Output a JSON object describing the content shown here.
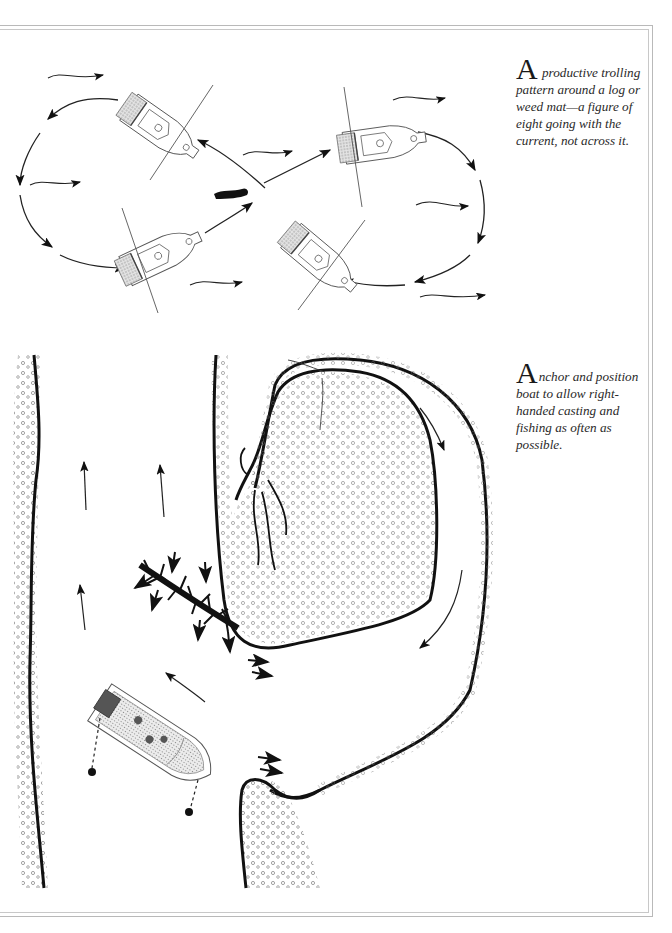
{
  "page": {
    "type": "illustrated-book-page",
    "frame": {
      "style": "double-rule",
      "color": "#b9b9b9"
    }
  },
  "figures": [
    {
      "id": "trolling-pattern",
      "caption": {
        "dropcap": "A",
        "text": " productive trolling pattern around a log or weed mat—a figure of eight going with the current, not across it."
      },
      "elements": {
        "boats": 4,
        "center_object": "log-or-weed-mat",
        "path": "figure-of-eight",
        "current_arrows": 6
      }
    },
    {
      "id": "anchor-position",
      "caption": {
        "dropcap": "A",
        "text": "nchor and position boat to allow right-handed casting and fishing as often as possible."
      },
      "elements": {
        "boats": 1,
        "anchors": 2,
        "features": [
          "river-banks",
          "backwater-bay",
          "fallen-tree",
          "current-arrows"
        ]
      }
    }
  ],
  "colors": {
    "ink": "#111111",
    "light_ink": "#555555",
    "shading": "#bdbdbd",
    "frame": "#b9b9b9"
  }
}
